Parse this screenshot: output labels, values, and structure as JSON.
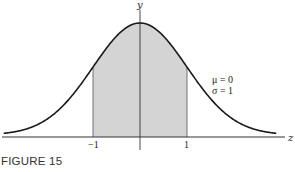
{
  "chart_data": {
    "type": "area",
    "title": "",
    "caption": "FIGURE 15",
    "xlabel": "z",
    "ylabel": "y",
    "x_ticks": [
      "-1",
      "1"
    ],
    "xlim": [
      -2.9,
      2.9
    ],
    "distribution": {
      "mean": 0,
      "std": 1
    },
    "shaded_interval": [
      -1,
      1
    ],
    "annotation": [
      "μ = 0",
      "σ = 1"
    ],
    "grid": false,
    "legend": "none",
    "colors": {
      "curve": "#1a1a1a",
      "shade": "#d4d4d4",
      "axis": "#333333"
    }
  },
  "labels": {
    "y_axis": "y",
    "z_axis": "z",
    "tick_neg1": "−1",
    "tick_pos1": "1",
    "mu": "μ = 0",
    "sigma": "σ = 1",
    "caption": "FIGURE 15"
  }
}
